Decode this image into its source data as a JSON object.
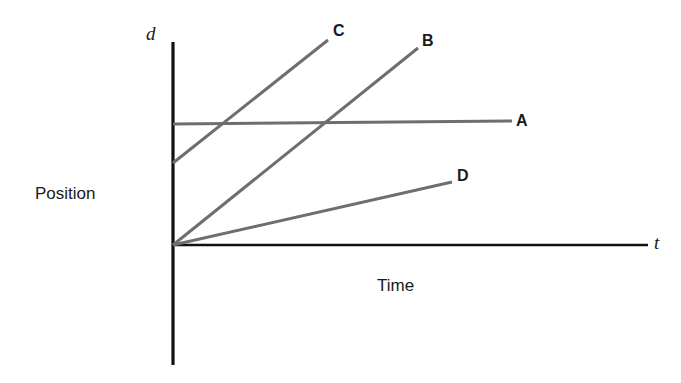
{
  "figure": {
    "background_color": "#ffffff",
    "width": 681,
    "height": 383
  },
  "axes": {
    "y_axis_symbol": "d",
    "x_axis_symbol": "t",
    "y_axis_title": "Position",
    "x_axis_title": "Time",
    "axis_color": "#111111"
  },
  "labels": {
    "A": "A",
    "B": "B",
    "C": "C",
    "D": "D"
  },
  "chart_data": {
    "type": "line",
    "title": "",
    "subtitle": "",
    "xlabel": "Time",
    "ylabel": "Position",
    "x_axis_symbol": "t",
    "y_axis_symbol": "d",
    "xlim": [
      0,
      100
    ],
    "ylim": [
      0,
      100
    ],
    "grid": false,
    "ticks": {
      "x": [],
      "y": []
    },
    "legend": "inline-end-labels",
    "legend_position": "line-end",
    "line_color": "#6e6e6e",
    "series": [
      {
        "name": "A",
        "label": "A",
        "description": "Nearly flat line starting at a positive intercept; constant position (zero velocity)",
        "x": [
          0,
          71
        ],
        "y": [
          37.5,
          38.5
        ],
        "slope": 0.014,
        "intercept": 37.5,
        "color": "#6e6e6e"
      },
      {
        "name": "B",
        "label": "B",
        "description": "Steep line through the origin; large constant velocity",
        "x": [
          0,
          51.6
        ],
        "y": [
          0,
          61.3
        ],
        "slope": 1.19,
        "intercept": 0,
        "color": "#6e6e6e"
      },
      {
        "name": "C",
        "label": "C",
        "description": "Steepest line starting at a positive intercept; largest constant velocity",
        "x": [
          0,
          32.6
        ],
        "y": [
          25.5,
          63.8
        ],
        "slope": 1.18,
        "intercept": 25.5,
        "color": "#6e6e6e"
      },
      {
        "name": "D",
        "label": "D",
        "description": "Shallow line through the origin; small constant velocity",
        "x": [
          0,
          58.7
        ],
        "y": [
          0,
          19.6
        ],
        "slope": 0.33,
        "intercept": 0,
        "color": "#6e6e6e"
      }
    ],
    "geometry_px": {
      "origin": [
        173,
        245
      ],
      "y_axis": [
        173,
        42,
        173,
        365
      ],
      "x_axis": [
        173,
        245,
        648,
        245
      ],
      "lines": {
        "A": [
          173,
          124,
          512,
          121
        ],
        "B": [
          173,
          245,
          418,
          48
        ],
        "C": [
          173,
          163,
          328,
          40
        ],
        "D": [
          173,
          245,
          452,
          182
        ]
      }
    }
  }
}
